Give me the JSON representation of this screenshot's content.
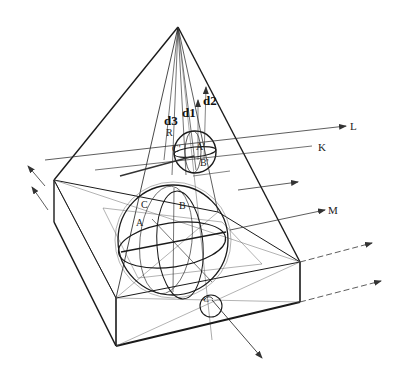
{
  "diagram": {
    "labels": {
      "d1": "d1",
      "d2": "d2",
      "d3": "d3",
      "R": "R",
      "L": "L",
      "K": "K",
      "M": "M",
      "small_C": "C'",
      "small_A": "A'",
      "small_B": "B'",
      "big_C": "C",
      "big_A": "A",
      "big_B": "B",
      "bottom_C": "C"
    },
    "colors": {
      "ink": "#1a1a1a",
      "thin_ink": "#555555",
      "background": "#ffffff"
    }
  }
}
